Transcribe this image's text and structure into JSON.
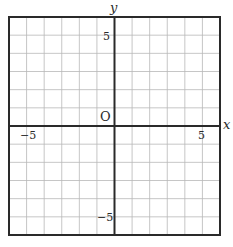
{
  "diagram": {
    "type": "coordinate-grid",
    "x_range": [
      -6,
      6
    ],
    "y_range": [
      -6,
      6
    ],
    "grid_step": 1,
    "colors": {
      "background": "#ffffff",
      "grid_line": "#b8b8b8",
      "axis_line": "#2a2a2a",
      "border": "#2a2a2a",
      "text": "#2a2a2a"
    },
    "labels": {
      "x_axis": "x",
      "y_axis": "y",
      "origin": "O",
      "x_tick_neg": "−5",
      "x_tick_pos": "5",
      "y_tick_pos": "5",
      "y_tick_neg": "−5"
    }
  }
}
